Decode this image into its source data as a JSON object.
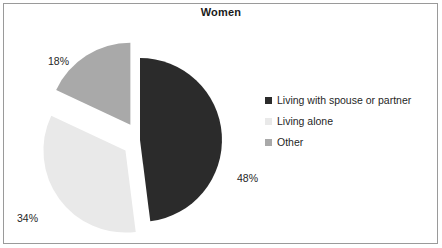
{
  "chart_data": {
    "type": "pie",
    "title": "Women",
    "categories": [
      "Living with spouse or partner",
      "Living alone",
      "Other"
    ],
    "values": [
      48,
      34,
      18
    ],
    "value_labels": [
      "48%",
      "34%",
      "18%"
    ],
    "colors": [
      "#2b2b2b",
      "#e9e9e9",
      "#a9a9a9"
    ],
    "exploded": [
      false,
      true,
      true
    ],
    "legend_position": "right",
    "grid": false,
    "units": "percent"
  },
  "frame": {
    "border_color": "#9a9a9a",
    "background": "#ffffff"
  },
  "title": {
    "text": "Women"
  },
  "labels": {
    "spouse": "48%",
    "alone": "34%",
    "other": "18%"
  },
  "legend": {
    "items": [
      {
        "label": "Living with spouse or partner",
        "color": "#2b2b2b",
        "swatch_name": "legend-swatch-spouse"
      },
      {
        "label": "Living alone",
        "color": "#e9e9e9",
        "swatch_name": "legend-swatch-alone"
      },
      {
        "label": "Other",
        "color": "#a9a9a9",
        "swatch_name": "legend-swatch-other"
      }
    ]
  }
}
